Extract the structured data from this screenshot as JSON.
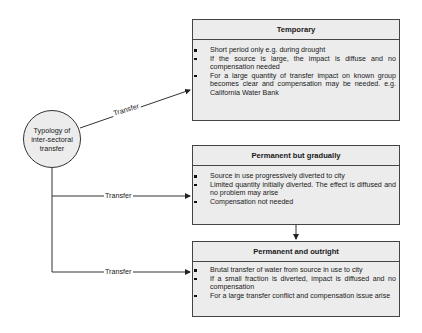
{
  "diagram": {
    "root": {
      "label_lines": [
        "Typology of",
        "inter-sectoral",
        "transfer"
      ]
    },
    "edge_label": "Transfer",
    "edges": [
      {
        "from": "root",
        "to": "temporary",
        "label": "Transfer"
      },
      {
        "from": "root",
        "to": "permanent_gradual",
        "label": "Transfer"
      },
      {
        "from": "root",
        "to": "permanent_outright",
        "label": "Transfer"
      },
      {
        "from": "permanent_gradual",
        "to": "permanent_outright",
        "label": ""
      }
    ],
    "boxes": [
      {
        "id": "temporary",
        "title": "Temporary",
        "bullets": [
          "Short period only e.g. during drought",
          "If the source is large, the impact is diffuse and no compensation needed",
          "For a large quantity of transfer impact on known group becomes clear and compensation may be needed. e.g. California Water Bank"
        ]
      },
      {
        "id": "permanent_gradual",
        "title": "Permanent but gradually",
        "bullets": [
          "Source in use progressively diverted to city",
          "Limited quantity initially diverted. The effect is diffused and no problem may arise",
          "Compensation not needed"
        ]
      },
      {
        "id": "permanent_outright",
        "title": "Permanent and outright",
        "bullets": [
          "Brutal transfer of water from source in use to city",
          "If a small fraction is diverted, impact is diffused and no compensation",
          "For a large transfer conflict and compensation issue arise"
        ]
      }
    ],
    "colors": {
      "box_fill": "#ececec",
      "stroke": "#444444",
      "background": "#ffffff"
    }
  }
}
